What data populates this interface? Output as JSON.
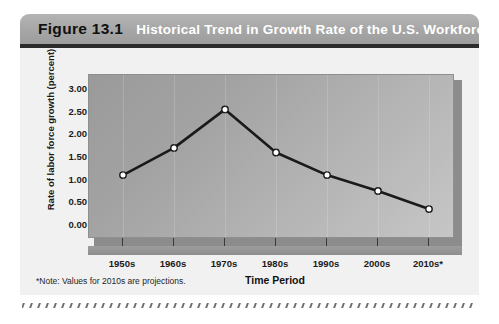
{
  "figure": {
    "number_label": "Figure 13.1",
    "title": "Historical Trend in Growth Rate of the U.S. Workforce",
    "note": "*Note: Values for 2010s are projections."
  },
  "colors": {
    "header_bg": "#a6a6a6",
    "header_text": "#ffffff",
    "figure_number_text": "#111111",
    "panel_light": "#c6c6c6",
    "panel_dark": "#9a9a9a",
    "line": "#1a1a1a",
    "marker_fill": "#ffffff",
    "card_bg": "#f1f1f1"
  },
  "chart_data": {
    "type": "line",
    "title": "Historical Trend in Growth Rate of the U.S. Workforce",
    "xlabel": "Time Period",
    "ylabel": "Rate of labor force growth (percent)",
    "categories": [
      "1950s",
      "1960s",
      "1970s",
      "1980s",
      "1990s",
      "2000s",
      "2010s*"
    ],
    "values": [
      1.1,
      1.7,
      2.55,
      1.6,
      1.1,
      0.75,
      0.35
    ],
    "ylim": [
      0.0,
      3.0
    ],
    "ytick_labels": [
      "3.00",
      "2.50",
      "2.00",
      "1.50",
      "1.00",
      "0.50",
      "0.00"
    ],
    "ytick_values": [
      3.0,
      2.5,
      2.0,
      1.5,
      1.0,
      0.5,
      0.0
    ],
    "grid": false,
    "legend": "none",
    "marker": "circle",
    "annotations": [
      "*Note: Values for 2010s are projections."
    ]
  }
}
